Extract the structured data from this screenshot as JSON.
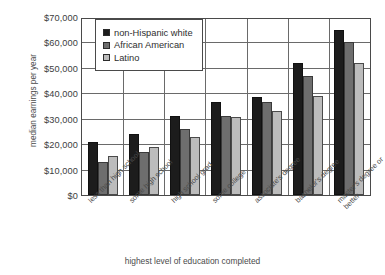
{
  "chart_data": {
    "type": "bar",
    "title": "",
    "xlabel": "highest level of education completed",
    "ylabel": "median earnings per year",
    "categories": [
      "less than high school",
      "some high school",
      "high school grad",
      "some college",
      "associate's degree",
      "bachelor's degree",
      "master's degree or better"
    ],
    "series": [
      {
        "name": "non-Hispanic white",
        "color": "#1c1c1c",
        "values": [
          21000,
          24000,
          31000,
          36500,
          38500,
          52000,
          65000
        ]
      },
      {
        "name": "African American",
        "color": "#6e6e6e",
        "values": [
          13000,
          17000,
          26000,
          31000,
          36500,
          47000,
          60000
        ]
      },
      {
        "name": "Latino",
        "color": "#bcbcbc",
        "values": [
          15500,
          19000,
          23000,
          30500,
          33000,
          39000,
          52000
        ]
      }
    ],
    "ylim": [
      0,
      70000
    ],
    "ytick_values": [
      0,
      10000,
      20000,
      30000,
      40000,
      50000,
      60000,
      70000
    ],
    "ytick_labels": [
      "$0",
      "$10,000",
      "$20,000",
      "$30,000",
      "$40,000",
      "$50,000",
      "$60,000",
      "$70,000"
    ],
    "grid": true,
    "legend_position": "top-left-inside"
  }
}
